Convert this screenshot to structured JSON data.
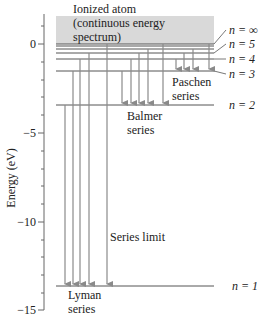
{
  "axis": {
    "label": "Energy (eV)",
    "ticks": [
      {
        "value": 0,
        "label": "0"
      },
      {
        "value": -5,
        "label": "−5"
      },
      {
        "value": -10,
        "label": "−10"
      },
      {
        "value": -15,
        "label": "−15"
      }
    ],
    "minor_tick_step": 1,
    "range": [
      1.5,
      -15
    ]
  },
  "continuum": {
    "line1": "Ionized atom",
    "line2": "(continuous energy",
    "line3": "spectrum)",
    "fill": "#d9d9d9"
  },
  "levels": [
    {
      "n": "∞",
      "label": "n = ∞",
      "energy": 0
    },
    {
      "n": "5",
      "label": "n = 5",
      "energy": -0.54
    },
    {
      "n": "4",
      "label": "n = 4",
      "energy": -0.85
    },
    {
      "n": "3",
      "label": "n = 3",
      "energy": -1.51
    },
    {
      "n": "2",
      "label": "n = 2",
      "energy": -3.4
    },
    {
      "n": "1",
      "label": "n = 1",
      "energy": -13.6
    }
  ],
  "series": [
    {
      "name": "Lyman",
      "label_line1": "Lyman",
      "label_line2": "series",
      "final_level": 1
    },
    {
      "name": "Balmer",
      "label_line1": "Balmer",
      "label_line2": "series",
      "final_level": 2
    },
    {
      "name": "Paschen",
      "label_line1": "Paschen",
      "label_line2": "series",
      "final_level": 3
    }
  ],
  "annotations": {
    "series_limit": "Series limit"
  },
  "colors": {
    "level_line": "#555555",
    "arrow": "#8a8a8a",
    "axis": "#555555"
  }
}
